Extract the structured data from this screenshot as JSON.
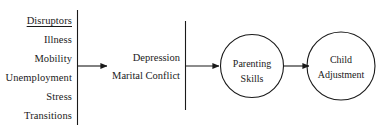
{
  "diagram": {
    "type": "conceptual-path-model",
    "background_color": "#ffffff",
    "line_color": "#1a1a1a",
    "text_color": "#1a1a1a",
    "disruptors": {
      "heading": "Disruptors",
      "items": [
        "Illness",
        "Mobility",
        "Unemployment",
        "Stress",
        "Transitions"
      ]
    },
    "mediators": {
      "items": [
        "Depression",
        "Marital Conflict"
      ]
    },
    "nodes": [
      {
        "id": "parenting-skills",
        "line1": "Parenting",
        "line2": "Skills"
      },
      {
        "id": "child-adjustment",
        "line1": "Child",
        "line2": "Adjustment"
      }
    ]
  }
}
